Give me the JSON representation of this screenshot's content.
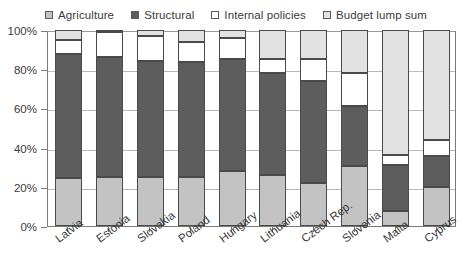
{
  "chart_data": {
    "type": "bar",
    "subtype": "stacked-percentage-column",
    "title": "",
    "xlabel": "",
    "ylabel": "",
    "ylim": [
      0,
      100
    ],
    "y_unit": "%",
    "y_ticks": [
      "0%",
      "20%",
      "40%",
      "60%",
      "80%",
      "100%"
    ],
    "y_tick_values": [
      0,
      20,
      40,
      60,
      80,
      100
    ],
    "grid": true,
    "legend_position": "top-center",
    "categories": [
      "Latvia",
      "Estonia",
      "Slovakia",
      "Poland",
      "Hungary",
      "Lithuania",
      "Czech Rep.",
      "Slovenia",
      "Malta",
      "Cyprus"
    ],
    "series": [
      {
        "name": "Agriculture",
        "color": "#c3c3c3",
        "values": [
          24.6,
          25.0,
          25.0,
          25.0,
          28.0,
          26.0,
          22.0,
          30.5,
          7.5,
          20.0
        ]
      },
      {
        "name": "Structural",
        "color": "#5d5d5d",
        "values": [
          63.4,
          61.0,
          59.0,
          58.5,
          57.0,
          52.0,
          52.0,
          30.5,
          23.5,
          15.5
        ]
      },
      {
        "name": "Internal policies",
        "color": "#ffffff",
        "values": [
          7.0,
          13.0,
          13.0,
          10.5,
          11.0,
          7.0,
          11.0,
          17.0,
          5.0,
          8.5
        ]
      },
      {
        "name": "Budget lump sum",
        "color": "#e2e2e2",
        "values": [
          5.0,
          1.0,
          3.0,
          6.0,
          4.0,
          15.0,
          15.0,
          22.0,
          64.0,
          56.0
        ]
      }
    ]
  },
  "legend": {
    "items": [
      {
        "label": "Agriculture",
        "color": "#c3c3c3"
      },
      {
        "label": "Structural",
        "color": "#5d5d5d"
      },
      {
        "label": "Internal policies",
        "color": "#ffffff"
      },
      {
        "label": "Budget lump sum",
        "color": "#e2e2e2"
      }
    ]
  }
}
